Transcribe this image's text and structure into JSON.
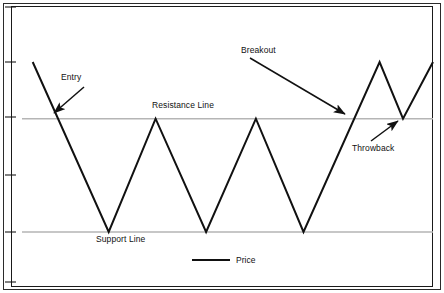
{
  "figure": {
    "width": 444,
    "height": 293,
    "background": "#ffffff",
    "border_color": "#2b2b2b"
  },
  "legend": {
    "label": "Price",
    "position": "bottom-center",
    "swatch_color": "#111111"
  },
  "annotations": {
    "entry": "Entry",
    "breakout": "Breakout",
    "throwback": "Throwback",
    "resistance": "Resistance Line",
    "support": "Support Line"
  },
  "chart_data": {
    "type": "line",
    "title": "",
    "xlabel": "",
    "ylabel": "",
    "grid": false,
    "legend_position": "bottom-center",
    "xlim": [
      0,
      10
    ],
    "ylim": [
      0,
      5
    ],
    "axis_ticks": {
      "x": [],
      "y": [
        0.5,
        1.0,
        2.0,
        3.0,
        4.0,
        4.5
      ]
    },
    "series": [
      {
        "name": "Price",
        "color": "#111111",
        "line_width": 2,
        "points": [
          {
            "x": 0.26,
            "y": 4.0,
            "label": "start high"
          },
          {
            "x": 2.11,
            "y": 1.0,
            "label": "trough 1 (support)"
          },
          {
            "x": 3.25,
            "y": 3.0,
            "label": "peak 1 (resistance)"
          },
          {
            "x": 4.48,
            "y": 1.0,
            "label": "trough 2 (support)"
          },
          {
            "x": 5.69,
            "y": 3.0,
            "label": "peak 2 (resistance)"
          },
          {
            "x": 6.85,
            "y": 1.0,
            "label": "trough 3 (support)"
          },
          {
            "x": 8.7,
            "y": 4.0,
            "label": "peak 3 (breakout high)"
          },
          {
            "x": 9.27,
            "y": 3.0,
            "label": "throwback low (resistance)"
          },
          {
            "x": 10.0,
            "y": 4.0,
            "label": "end high"
          }
        ]
      }
    ],
    "reference_lines": [
      {
        "name": "Resistance Line",
        "y": 3.0,
        "color": "#b5b5b5",
        "orientation": "horizontal",
        "label": "Resistance Line"
      },
      {
        "name": "Support Line",
        "y": 1.0,
        "color": "#b5b5b5",
        "orientation": "horizontal",
        "label": "Support Line"
      }
    ],
    "annotations": [
      {
        "text": "Entry",
        "target_x": 0.97,
        "target_y": 3.0,
        "description": "price crosses below resistance line on initial decline"
      },
      {
        "text": "Breakout",
        "target_x": 8.0,
        "target_y": 3.0,
        "description": "price crosses above resistance line"
      },
      {
        "text": "Throwback",
        "target_x": 9.27,
        "target_y": 3.0,
        "description": "price retests resistance line from above"
      }
    ]
  }
}
